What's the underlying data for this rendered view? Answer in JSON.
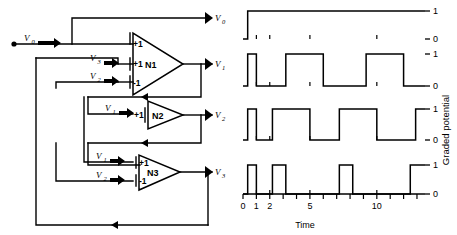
{
  "figure": {
    "title": "",
    "circuit": {
      "source_label": "V0",
      "source_sub": "0",
      "neurons": [
        {
          "name": "N1",
          "output_label": "V",
          "output_sub": "1",
          "inputs": [
            {
              "source": "V",
              "sub": "0",
              "weight": "+1",
              "label_shown": false
            },
            {
              "source": "V",
              "sub": "3",
              "weight": "+1",
              "label_shown": true
            },
            {
              "source": "V",
              "sub": "2",
              "weight": "-1",
              "label_shown": true
            }
          ]
        },
        {
          "name": "N2",
          "output_label": "V",
          "output_sub": "2",
          "inputs": [
            {
              "source": "V",
              "sub": "1",
              "weight": "+1",
              "label_shown": true
            }
          ]
        },
        {
          "name": "N3",
          "output_label": "V",
          "output_sub": "3",
          "inputs": [
            {
              "source": "V",
              "sub": "1",
              "weight": "+1",
              "label_shown": true
            },
            {
              "source": "V",
              "sub": "2",
              "weight": "-1",
              "label_shown": true
            }
          ]
        }
      ],
      "weights": {
        "excitatory": "+1",
        "inhibitory": "-1"
      }
    }
  },
  "chart_data": {
    "type": "line",
    "title": "",
    "xlabel": "Time",
    "ylabel": "Graded potential",
    "xlim": [
      0,
      13.6
    ],
    "ylim": [
      0,
      1
    ],
    "grid": false,
    "legend_position": "none",
    "xticks": [
      0,
      1,
      2,
      3,
      4,
      5,
      6,
      7,
      8,
      9,
      10,
      11,
      12,
      13
    ],
    "xticklabels_shown": [
      "0",
      "1",
      "2",
      "5",
      "10"
    ],
    "xticklabel_values": [
      0,
      1,
      2,
      5,
      10
    ],
    "yticks": [
      0,
      1
    ],
    "yticklabels": [
      "0",
      "1"
    ],
    "step_style": "square",
    "series": [
      {
        "name": "V0",
        "label": "V",
        "sublabel": "0",
        "x": [
          0,
          0.35,
          0.35,
          13.6
        ],
        "values": [
          0,
          0,
          1,
          1
        ],
        "description": "steps high at t=0.35 and remains at 1"
      },
      {
        "name": "V1",
        "label": "V",
        "sublabel": "1",
        "x": [
          0,
          0.35,
          0.35,
          1.0,
          1.0,
          3.2,
          3.2,
          6.0,
          6.0,
          9.2,
          9.2,
          12.0,
          12.0,
          13.6
        ],
        "values": [
          0,
          0,
          1,
          1,
          0,
          0,
          1,
          1,
          0,
          0,
          1,
          1,
          0,
          0
        ],
        "description": "pulse at 0.35-1.0, high 3.2-6.0, high 9.2-12.0, rises again at 13.0"
      },
      {
        "name": "V2",
        "label": "V",
        "sublabel": "2",
        "x": [
          0,
          0.35,
          0.35,
          1.0,
          1.0,
          2.2,
          2.2,
          5.0,
          5.0,
          7.2,
          7.2,
          10.0,
          10.0,
          12.9,
          12.9,
          13.6
        ],
        "values": [
          0,
          0,
          1,
          1,
          0,
          0,
          1,
          1,
          0,
          0,
          1,
          1,
          0,
          0,
          1,
          1
        ],
        "description": "brief pulse at start, high 2.2-5.0, high 7.2-10.0, rises at 12.9"
      },
      {
        "name": "V3",
        "label": "V",
        "sublabel": "3",
        "x": [
          0,
          0.35,
          0.35,
          1.0,
          1.0,
          2.2,
          2.2,
          3.2,
          3.2,
          7.2,
          7.2,
          8.2,
          8.2,
          12.5,
          12.5,
          13.6
        ],
        "values": [
          0,
          0,
          1,
          1,
          0,
          0,
          1,
          1,
          0,
          0,
          1,
          1,
          0,
          0,
          1,
          1
        ],
        "description": "narrow pulses: 2.2-3.2 and 7.2-8.2, rises at 12.5"
      }
    ]
  }
}
